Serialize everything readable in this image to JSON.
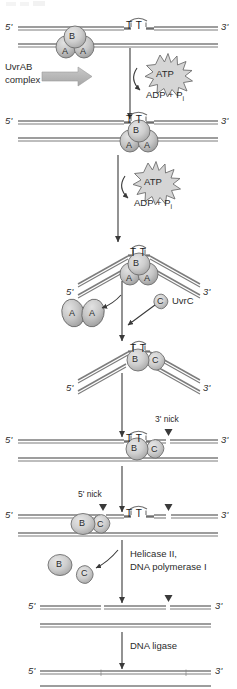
{
  "diagram": {
    "type": "biological-pathway",
    "colors": {
      "strand": "#7d7d7d",
      "protein_fill": "#c8c8c8",
      "protein_stroke": "#6e6e6e",
      "arrow": "#3a3a3a",
      "block_arrow": "#b4b4b4",
      "text": "#2b2b2b"
    }
  },
  "labels": {
    "five_prime": "5'",
    "three_prime": "3'",
    "thymine_dimer": "T T",
    "uvrab_complex_line1": "UvrAB",
    "uvrab_complex_line2": "complex",
    "atp": "ATP",
    "adp_pi": "ADP + P",
    "adp_pi_subscript": "i",
    "uvrc": "UvrC",
    "three_prime_nick": "3' nick",
    "five_prime_nick": "5' nick",
    "helicase_line1": "Helicase II,",
    "helicase_line2": "DNA polymerase I",
    "dna_ligase": "DNA ligase"
  },
  "subunits": {
    "a": "A",
    "b": "B",
    "c": "C"
  },
  "steps": [
    {
      "id": "step-1-recognition",
      "caption": "UvrAB complex binds DNA containing a thymine dimer",
      "strand_y": 28,
      "proteins": [
        "B",
        "A",
        "A"
      ]
    },
    {
      "id": "step-2-translocation",
      "caption": "ATP hydrolysis translocates UvrAB to the lesion",
      "strand_y": 122,
      "proteins": [
        "B",
        "A",
        "A"
      ],
      "energy": "ATP to ADP + Pi"
    },
    {
      "id": "step-3-bending",
      "caption": "DNA is bent at the dimer; UvrA dimer is released",
      "strand_y": 248,
      "proteins": [
        "B",
        "A",
        "A"
      ]
    },
    {
      "id": "step-4-uvrc-binding",
      "caption": "UvrC binds the UvrB-DNA complex",
      "strand_y": 345,
      "proteins": [
        "B",
        "C"
      ]
    },
    {
      "id": "step-5-three-prime-incision",
      "caption": "UvrC makes the 3' incision",
      "strand_y": 440,
      "proteins": [
        "B",
        "C"
      ],
      "nick": "3' nick"
    },
    {
      "id": "step-6-five-prime-incision",
      "caption": "UvrC makes the 5' incision releasing a 12-13mer",
      "strand_y": 515,
      "proteins": [
        "B",
        "C"
      ],
      "nick": "5' nick"
    },
    {
      "id": "step-7-excision-resynthesis",
      "caption": "Helicase II and DNA polymerase I remove the oligonucleotide and fill the gap",
      "strand_y": 608,
      "proteins": [
        "B",
        "C"
      ]
    },
    {
      "id": "step-8-ligation",
      "caption": "DNA ligase seals the remaining nick",
      "strand_y": 672,
      "proteins": []
    }
  ]
}
